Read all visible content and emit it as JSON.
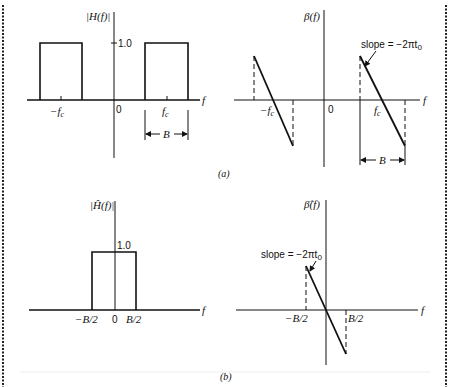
{
  "figure": {
    "panel_a": {
      "caption": "(a)",
      "magnitude_plot": {
        "ylabel": "|H(f)|",
        "xlabel": "f",
        "level_label": "1.0",
        "tick_neg_fc": "−f",
        "tick_neg_fc_sub": "c",
        "origin": "0",
        "tick_fc": "f",
        "tick_fc_sub": "c",
        "bandwidth_label": "B"
      },
      "phase_plot": {
        "ylabel": "β(f)",
        "xlabel": "f",
        "tick_neg_fc": "−f",
        "tick_neg_fc_sub": "c",
        "origin": "0",
        "tick_fc": "f",
        "tick_fc_sub": "c",
        "slope_label": "slope = −2πt",
        "slope_sub": "0",
        "bandwidth_label": "B"
      }
    },
    "panel_b": {
      "caption": "(b)",
      "magnitude_plot": {
        "ylabel": "|Ĥ(f)|",
        "xlabel": "f",
        "level_label": "1.0",
        "tick_neg": "−B/2",
        "origin": "0",
        "tick_pos": "B/2"
      },
      "phase_plot": {
        "ylabel": "β̂(f)",
        "xlabel": "f",
        "tick_neg": "−B/2",
        "tick_pos": "B/2",
        "slope_label": "slope = −2πt",
        "slope_sub": "0"
      }
    }
  }
}
